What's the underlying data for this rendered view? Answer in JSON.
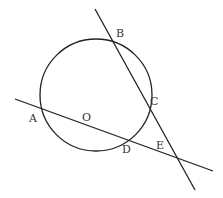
{
  "diagram": {
    "circle": {
      "cx": 96,
      "cy": 95,
      "r": 56
    },
    "lines": [
      {
        "name": "line-AE",
        "x1": 15,
        "y1": 99,
        "x2": 213,
        "y2": 171
      },
      {
        "name": "line-BE",
        "x1": 95,
        "y1": 9,
        "x2": 195,
        "y2": 190
      }
    ],
    "labels": {
      "A": "A",
      "B": "B",
      "C": "C",
      "D": "D",
      "E": "E",
      "O": "O"
    },
    "stroke_color": "#222222"
  }
}
